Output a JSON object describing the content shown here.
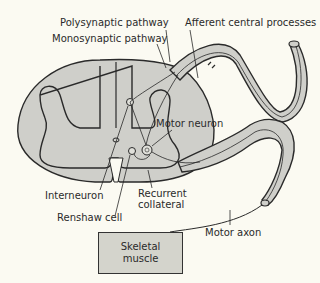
{
  "diagram": {
    "type": "spinal reflex pathway",
    "colors": {
      "background": "#fbfaf2",
      "tissue_fill": "#cfcfca",
      "outline": "#2a2a2a"
    },
    "labels": {
      "polysynaptic": "Polysynaptic pathway",
      "monosynaptic": "Monosynaptic pathway",
      "afferent": "Afferent central processes",
      "motor_neuron": "Motor neuron",
      "interneuron": "Interneuron",
      "recurrent_line1": "Recurrent",
      "recurrent_line2": "collateral",
      "renshaw": "Renshaw cell",
      "motor_axon": "Motor axon"
    },
    "muscle_box": {
      "line1": "Skeletal",
      "line2": "muscle"
    }
  }
}
